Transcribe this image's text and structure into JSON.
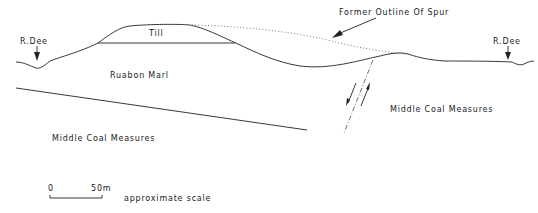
{
  "diagram": {
    "type": "geological cross-section",
    "labels": {
      "river_left": "R.Dee",
      "river_right": "R.Dee",
      "till": "Till",
      "ruabon_marl": "Ruabon Marl",
      "middle_coal_left": "Middle Coal Measures",
      "middle_coal_right": "Middle Coal Measures",
      "former_outline": "Former Outline Of Spur"
    },
    "scale": {
      "start": "0",
      "end": "50m",
      "caption": "approximate scale"
    },
    "colors": {
      "line": "#222222",
      "background": "#ffffff"
    }
  }
}
